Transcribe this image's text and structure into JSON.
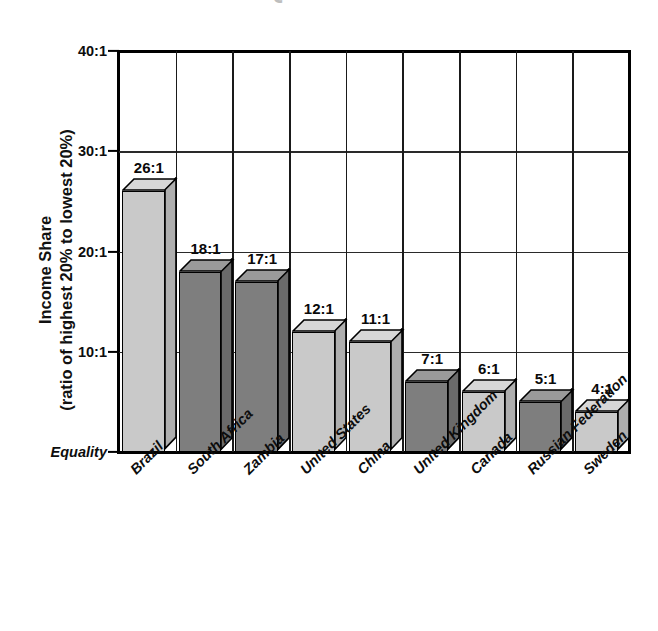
{
  "figure": {
    "title_cropped": "GLOBAL INEQUALITY",
    "axis_title_line1": "Income Share",
    "axis_title_line2": "(ratio of highest 20% to lowest 20%)"
  },
  "chart_data": {
    "type": "bar",
    "title": "GLOBAL INEQUALITY",
    "xlabel": "",
    "ylabel": "Income Share (ratio of highest 20% to lowest 20%)",
    "ylim": [
      0,
      40
    ],
    "yticks": [
      0,
      10,
      20,
      30,
      40
    ],
    "ytick_labels": [
      "Equality",
      "10:1",
      "20:1",
      "30:1",
      "40:1"
    ],
    "grid": "both",
    "legend": "none",
    "categories": [
      "Brazil",
      "South Africa",
      "Zambia",
      "United States",
      "China",
      "United Kingdom",
      "Canada",
      "Russian Federation",
      "Sweden"
    ],
    "values": [
      26,
      18,
      17,
      12,
      11,
      7,
      6,
      5,
      4
    ],
    "data_labels": [
      "26:1",
      "18:1",
      "17:1",
      "12:1",
      "11:1",
      "7:1",
      "6:1",
      "5:1",
      "4:1"
    ],
    "bar_shading": [
      "light",
      "dark",
      "dark",
      "light",
      "light",
      "dark",
      "light",
      "dark",
      "light"
    ],
    "colors": {
      "light_front": "#c9c9c9",
      "light_top": "#d7d7d7",
      "light_side": "#aeaeae",
      "dark_front": "#7e7e7e",
      "dark_top": "#9a9a9a",
      "dark_side": "#6a6a6a",
      "outline": "#000000",
      "background": "#ffffff"
    }
  }
}
